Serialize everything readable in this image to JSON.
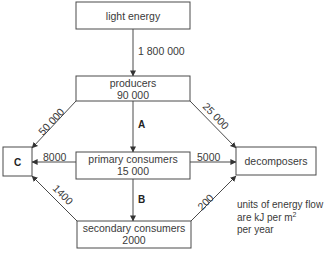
{
  "diagram": {
    "title": "",
    "nodes": {
      "light": {
        "label": "light energy"
      },
      "producers": {
        "label": "producers",
        "value": "90 000"
      },
      "primary": {
        "label": "primary consumers",
        "value": "15 000"
      },
      "secondary": {
        "label": "secondary consumers",
        "value": "2000"
      },
      "c": {
        "label": "C"
      },
      "decomposers": {
        "label": "decomposers"
      }
    },
    "flows": {
      "light_to_producers": "1 800 000",
      "producers_to_c": "50 000",
      "producers_to_decomposers": "25 000",
      "producers_to_primary": "A",
      "primary_to_c": "8000",
      "primary_to_decomposers": "5000",
      "primary_to_secondary": "B",
      "secondary_to_c": "1400",
      "secondary_to_decomposers": "200"
    },
    "units_note": {
      "line1": "units of energy flow",
      "line2_prefix": "are kJ per m",
      "line2_sup": "2",
      "line3": "per year"
    }
  }
}
